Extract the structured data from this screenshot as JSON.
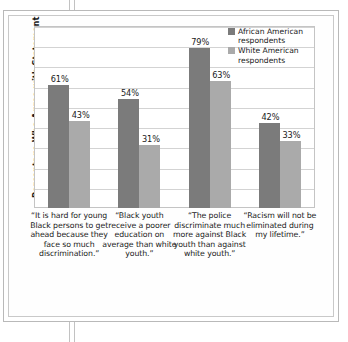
{
  "chart_data": {
    "type": "bar",
    "title": "",
    "xlabel": "",
    "ylabel": "Percentage Who Agree with Statement",
    "ylim": [
      0,
      90
    ],
    "grid": true,
    "grid_step": 10,
    "legend_position": "top-right",
    "value_suffix": "%",
    "categories": [
      "“It is hard for young Black persons to get ahead because they face so much discrimination.”",
      "“Black youth receive a poorer education on average than white youth.”",
      "“The police discriminate much more against Black youth than against white youth.”",
      "“Racism will not be eliminated during my lifetime.”"
    ],
    "series": [
      {
        "name": "African American respondents",
        "color": "#7b7b7b",
        "values": [
          61,
          54,
          79,
          42
        ],
        "labels": [
          "61%",
          "54%",
          "79%",
          "42%"
        ]
      },
      {
        "name": "White American respondents",
        "color": "#aaaaaa",
        "values": [
          43,
          31,
          63,
          33
        ],
        "labels": [
          "43%",
          "31%",
          "63%",
          "33%"
        ]
      }
    ]
  },
  "legend": {
    "entries": [
      {
        "label": "African American respondents",
        "swatch": "dark"
      },
      {
        "label": "White American respondents",
        "swatch": "light"
      }
    ]
  }
}
